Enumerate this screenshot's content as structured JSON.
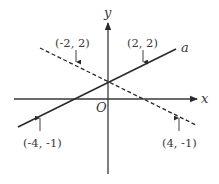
{
  "diagram": {
    "type": "coordinate-plane",
    "axes": {
      "x_label": "x",
      "y_label": "y",
      "origin_label": "O"
    },
    "lines": [
      {
        "name": "a",
        "style": "solid",
        "label": "a"
      },
      {
        "name": "dashed",
        "style": "dashed",
        "label": ""
      }
    ],
    "points": [
      {
        "label": "(-2, 2)",
        "on_line": "dashed"
      },
      {
        "label": "(2, 2)",
        "on_line": "a"
      },
      {
        "label": "(-4, -1)",
        "on_line": "a"
      },
      {
        "label": "(4, -1)",
        "on_line": "dashed"
      }
    ],
    "colors": {
      "stroke": "#2a2a2a",
      "text": "#3a3a3a"
    }
  }
}
